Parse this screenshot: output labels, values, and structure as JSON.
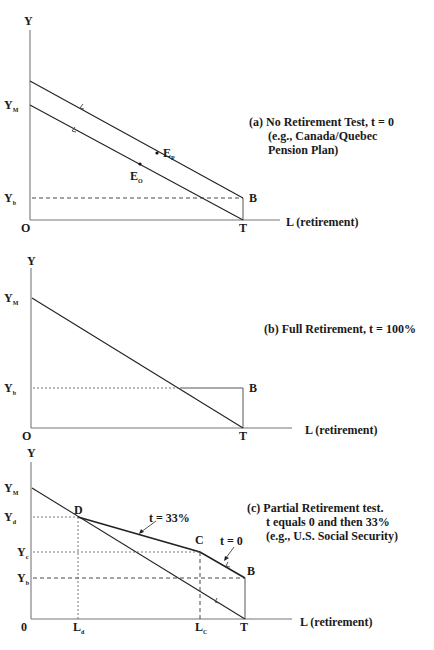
{
  "header_fragment": "",
  "panel_a": {
    "y_axis_label": "Y",
    "y_m_label": "Y",
    "y_m_sub": "M",
    "y_b_label": "Y",
    "y_b_sub": "b",
    "origin_label": "O",
    "t_label": "T",
    "b_label": "B",
    "x_axis_label": "L (retirement)",
    "e_p_label": "E",
    "e_p_sub": "P",
    "e_o_label": "E",
    "e_o_sub": "O",
    "caption_line1": "(a) No Retirement Test, t = 0",
    "caption_line2": "(e.g., Canada/Quebec",
    "caption_line3": "Pension Plan)"
  },
  "panel_b": {
    "y_axis_label": "Y",
    "y_m_label": "Y",
    "y_m_sub": "M",
    "y_b_label": "Y",
    "y_b_sub": "b",
    "origin_label": "O",
    "t_label": "T",
    "b_label": "B",
    "x_axis_label": "L (retirement)",
    "caption_line1": "(b) Full Retirement, t = 100%"
  },
  "panel_c": {
    "y_axis_label": "Y",
    "y_m_label": "Y",
    "y_m_sub": "M",
    "y_d_label": "Y",
    "y_d_sub": "d",
    "y_c_label": "Y",
    "y_c_sub": "c",
    "y_b_label": "Y",
    "y_b_sub": "b",
    "origin_label": "0",
    "l_d_label": "L",
    "l_d_sub": "d",
    "l_c_label": "L",
    "l_c_sub": "C",
    "t_label": "T",
    "d_label": "D",
    "c_label": "C",
    "b_label": "B",
    "x_axis_label": "L (retirement)",
    "t33_label": "t = 33%",
    "t0_label": "t = 0",
    "caption_line1": "(c) Partial Retirement test.",
    "caption_line2": "t equals 0 and then 33%",
    "caption_line3": "(e.g., U.S. Social Security)"
  }
}
